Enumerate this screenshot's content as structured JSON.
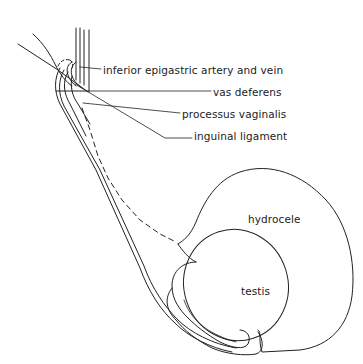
{
  "diagram": {
    "type": "anatomical line drawing",
    "labels": {
      "epigastric": "inferior epigastric artery and vein",
      "vas": "vas deferens",
      "processus": "processus vaginalis",
      "inguinal": "inguinal ligament",
      "hydrocele": "hydrocele",
      "testis": "testis"
    },
    "colors": {
      "line": "#222222",
      "background": "#ffffff"
    }
  }
}
